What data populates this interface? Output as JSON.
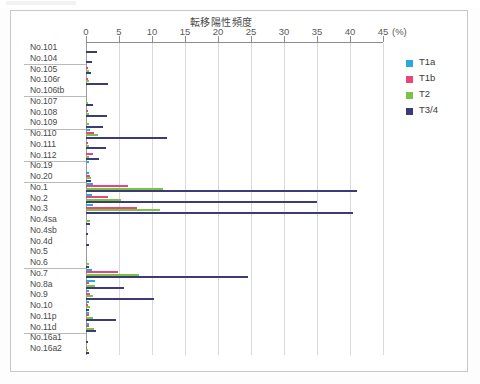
{
  "chart_data": {
    "type": "bar",
    "orientation": "horizontal",
    "title": "転移陽性頻度",
    "xlabel": "(%)",
    "ylabel": "",
    "xlim": [
      0,
      45
    ],
    "xticks": [
      0,
      5,
      10,
      15,
      20,
      25,
      30,
      35,
      40,
      45
    ],
    "xtick_labels": [
      "0",
      "5",
      "10",
      "15",
      "20",
      "25",
      "30",
      "35",
      "40",
      "45"
    ],
    "unit_label": "(%)",
    "grid": true,
    "legend_position": "right",
    "categories": [
      "No.101",
      "No.104",
      "No.105",
      "No.106r",
      "No.106tb",
      "No.107",
      "No.108",
      "No.109",
      "No.110",
      "No.111",
      "No.112",
      "No.19",
      "No.20",
      "No.1",
      "No.2",
      "No.3",
      "No.4sa",
      "No.4sb",
      "No.4d",
      "No.5",
      "No.6",
      "No.7",
      "No.8a",
      "No.9",
      "No.10",
      "No.11p",
      "No.11d",
      "No.16a1",
      "No.16a2"
    ],
    "group_breaks_after": [
      "No.104",
      "No.106tb",
      "No.109",
      "No.112",
      "No.20",
      "No.6",
      "No.11d"
    ],
    "series": [
      {
        "name": "T1a",
        "color": "#29a8df",
        "values": [
          0,
          0,
          0,
          0,
          0,
          0,
          0,
          0,
          0.6,
          0,
          0,
          0.4,
          0.5,
          1.1,
          0.9,
          1.0,
          0,
          0,
          0,
          0,
          0,
          0.9,
          1.4,
          0.5,
          0.5,
          0.5,
          0.5,
          0,
          0
        ]
      },
      {
        "name": "T1b",
        "color": "#e8457c",
        "values": [
          0,
          0,
          0.3,
          0.3,
          0,
          0,
          0.3,
          0,
          1.2,
          0.3,
          1.1,
          0,
          0.6,
          6.4,
          3.4,
          7.8,
          0,
          0,
          0,
          0,
          0,
          4.9,
          0.4,
          0.6,
          0.3,
          0.5,
          0.5,
          0,
          0.2
        ]
      },
      {
        "name": "T2",
        "color": "#7dc242",
        "values": [
          0,
          0,
          0.5,
          0.4,
          0,
          0.3,
          0.4,
          0.4,
          1.8,
          0.4,
          0.5,
          0,
          0.7,
          11.7,
          5.3,
          11.2,
          0.6,
          0,
          0,
          0,
          0.5,
          8.0,
          1.3,
          1.1,
          0.6,
          1.0,
          1.2,
          0.2,
          0.3
        ]
      },
      {
        "name": "T3/4",
        "color": "#3b3b7a",
        "values": [
          1.6,
          0.9,
          0.8,
          3.3,
          0,
          1.0,
          3.2,
          2.6,
          12.3,
          3.1,
          2.0,
          0,
          0.8,
          41.0,
          35.0,
          40.5,
          0.6,
          0.3,
          0.5,
          0,
          0.4,
          24.5,
          5.8,
          10.3,
          0.5,
          4.6,
          1.5,
          0.3,
          0.4
        ]
      }
    ]
  },
  "legend": {
    "items": [
      {
        "label": "T1a",
        "color": "#29a8df"
      },
      {
        "label": "T1b",
        "color": "#e8457c"
      },
      {
        "label": "T2",
        "color": "#7dc242"
      },
      {
        "label": "T3/4",
        "color": "#3b3b7a"
      }
    ]
  }
}
